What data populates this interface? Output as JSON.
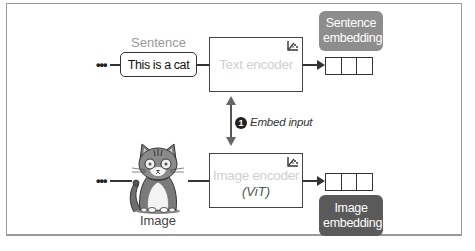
{
  "diagram": {
    "text_branch": {
      "input_label": "Sentence",
      "input_value": "This is a cat",
      "continuation": "•••",
      "encoder_label": "Text encoder",
      "encoder_icon": "fine-tune-icon",
      "output_label": "Sentence embedding",
      "output_vector_cells": 3
    },
    "image_branch": {
      "input_label": "Image",
      "input_image": "cat-illustration",
      "continuation": "•••",
      "encoder_label": "Image encoder",
      "encoder_sublabel": "(ViT)",
      "encoder_icon": "fine-tune-icon",
      "output_label": "Image embedding",
      "output_vector_cells": 3
    },
    "step": {
      "number": "1",
      "label": "Embed input"
    },
    "colors": {
      "frame": "#9a9a9a",
      "sentence_embedding_bg": "#8d8d8d",
      "image_embedding_bg": "#5a5a5a",
      "encoder_text": "#cfcfcf",
      "label_gray": "#9a9a9a"
    }
  }
}
